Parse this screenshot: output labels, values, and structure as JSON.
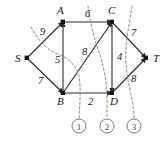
{
  "figure": {
    "type": "network-flow-graph",
    "nodes": [
      {
        "id": "S",
        "label": "S",
        "x": 27,
        "y": 58,
        "label_x": 15,
        "label_y": 62
      },
      {
        "id": "A",
        "label": "A",
        "x": 63,
        "y": 22,
        "label_x": 57,
        "label_y": 14
      },
      {
        "id": "C",
        "label": "C",
        "x": 112,
        "y": 22,
        "label_x": 108,
        "label_y": 14
      },
      {
        "id": "B",
        "label": "B",
        "x": 63,
        "y": 93,
        "label_x": 57,
        "label_y": 105
      },
      {
        "id": "D",
        "label": "D",
        "x": 112,
        "y": 93,
        "label_x": 110,
        "label_y": 105
      },
      {
        "id": "T",
        "label": "T",
        "x": 146,
        "y": 58,
        "label_x": 153,
        "label_y": 62
      }
    ],
    "edges": [
      {
        "from": "S",
        "to": "A",
        "weight": "9",
        "label_x": 40,
        "label_y": 35
      },
      {
        "from": "S",
        "to": "B",
        "weight": "7",
        "label_x": 38,
        "label_y": 84
      },
      {
        "from": "A",
        "to": "C",
        "weight": "6",
        "label_x": 85,
        "label_y": 17
      },
      {
        "from": "B",
        "to": "A",
        "weight": "5",
        "label_x": 55,
        "label_y": 63
      },
      {
        "from": "B",
        "to": "C",
        "weight": "8",
        "label_x": 82,
        "label_y": 55
      },
      {
        "from": "C",
        "to": "D",
        "weight": "4",
        "label_x": 117,
        "label_y": 60
      },
      {
        "from": "B",
        "to": "D",
        "weight": "2",
        "label_x": 88,
        "label_y": 105
      },
      {
        "from": "C",
        "to": "T",
        "weight": "7",
        "label_x": 131,
        "label_y": 36
      },
      {
        "from": "D",
        "to": "T",
        "weight": "8",
        "label_x": 131,
        "label_y": 82
      }
    ],
    "cuts": [
      {
        "id": "1",
        "label": "1",
        "circle_x": 79,
        "circle_y": 126,
        "radius": 7
      },
      {
        "id": "2",
        "label": "2",
        "circle_x": 107,
        "circle_y": 126,
        "radius": 7
      },
      {
        "id": "3",
        "label": "3",
        "circle_x": 134,
        "circle_y": 126,
        "radius": 7
      }
    ],
    "cut_paths": [
      "M 31 27 C 38 40, 46 50, 60 55 C 70 59, 76 66, 79 76 C 81 88, 80 104, 79 118",
      "M 88 6 C 90 20, 93 36, 99 52 C 104 66, 107 84, 107 100 C 107 110, 107 114, 107 118",
      "M 132 6 C 130 20, 127 34, 126 48 C 125 62, 127 78, 131 94 C 133 104, 134 112, 134 118"
    ]
  }
}
